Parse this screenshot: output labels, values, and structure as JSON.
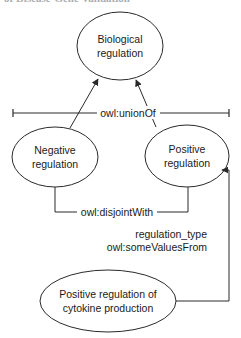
{
  "header": {
    "cropped_text": "of Disease-Gene Validation"
  },
  "colors": {
    "stroke": "#2a2a2a",
    "text": "#1a1a1a",
    "background": "#ffffff"
  },
  "nodes": {
    "biological_regulation": {
      "line1": "Biological",
      "line2": "regulation"
    },
    "negative_regulation": {
      "line1": "Negative",
      "line2": "regulation"
    },
    "positive_regulation": {
      "line1": "Positive",
      "line2": "regulation"
    },
    "positive_cytokine": {
      "line1": "Positive regulation of",
      "line2": "cytokine production"
    }
  },
  "edges": {
    "union": {
      "label": "owl:unionOf"
    },
    "disjoint": {
      "label": "owl:disjointWith"
    },
    "some_values": {
      "property": "regulation_type",
      "label": "owl:someValuesFrom"
    }
  }
}
